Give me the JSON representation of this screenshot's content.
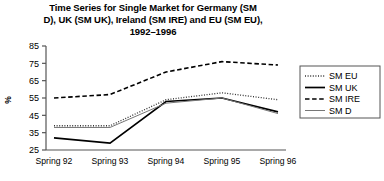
{
  "chart_data": {
    "type": "line",
    "title": "Time Series for Single Market for Germany (SM D), UK (SM UK), Ireland (SM IRE) and EU (SM EU), 1992–1996",
    "title_line1": "Time Series for Single Market for Germany (SM",
    "title_line2": "D), UK (SM UK), Ireland (SM IRE) and EU (SM EU),",
    "title_line3": "1992–1996",
    "xlabel": "",
    "ylabel": "%",
    "categories": [
      "Spring 92",
      "Spring 93",
      "Spring 94",
      "Spring 95",
      "Spring 96"
    ],
    "ylim": [
      25,
      85
    ],
    "yticks": [
      25,
      35,
      45,
      55,
      65,
      75,
      85
    ],
    "grid": false,
    "legend_position": "right",
    "series": [
      {
        "name": "SM EU",
        "values": [
          39,
          39,
          54,
          58,
          54
        ],
        "style": "dotted",
        "color": "#333333"
      },
      {
        "name": "SM UK",
        "values": [
          32,
          29,
          53,
          55,
          47
        ],
        "style": "solid-thick",
        "color": "#000000"
      },
      {
        "name": "SM IRE",
        "values": [
          55,
          57,
          70,
          76,
          74
        ],
        "style": "dashed",
        "color": "#000000"
      },
      {
        "name": "SM D",
        "values": [
          38,
          38,
          52,
          55,
          46
        ],
        "style": "solid-thin",
        "color": "#777777"
      }
    ]
  },
  "legend": {
    "items": [
      {
        "label": "SM EU"
      },
      {
        "label": "SM UK"
      },
      {
        "label": "SM IRE"
      },
      {
        "label": "SM D"
      }
    ]
  }
}
